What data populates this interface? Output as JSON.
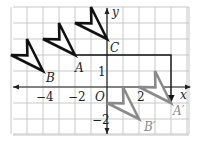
{
  "diagram": {
    "grid": {
      "x_min": -6,
      "x_max": 5,
      "y_min": -3,
      "y_max": 5,
      "origin_px": [
        107,
        87
      ],
      "unit_px": 16,
      "color": "#c8c8c8"
    },
    "axes": {
      "x_label": "x",
      "y_label": "y",
      "origin_label": "O",
      "x_tick_labels": [
        {
          "value": -4,
          "text": "−4"
        },
        {
          "value": -2,
          "text": "−2"
        },
        {
          "value": 2,
          "text": "2"
        }
      ],
      "y_tick_labels": [
        {
          "value": 1,
          "text": "1"
        },
        {
          "value": -2,
          "text": "−2"
        }
      ],
      "color": "#222222"
    },
    "figures": {
      "preimage_color": "#111111",
      "image_color": "#8a8a8a",
      "preimages": [
        {
          "name": "B",
          "label": "B",
          "tip": [
            -4,
            1
          ],
          "left_wing": [
            -6,
            2
          ],
          "top_wing": [
            -5,
            3
          ]
        },
        {
          "name": "A",
          "label": "A",
          "tip": [
            -2,
            2
          ],
          "left_wing": [
            -4,
            3
          ],
          "top_wing": [
            -3,
            4
          ]
        },
        {
          "name": "C",
          "label": "C",
          "tip": [
            0,
            3
          ],
          "left_wing": [
            -2,
            4
          ],
          "top_wing": [
            -1,
            5
          ]
        }
      ],
      "images": [
        {
          "name": "A'",
          "label": "A′",
          "tip": [
            4,
            -1
          ],
          "left_wing": [
            2,
            0
          ],
          "top_wing": [
            3,
            1
          ]
        },
        {
          "name": "B'",
          "label": "B′",
          "tip": [
            2,
            -2
          ],
          "left_wing": [
            0,
            -1
          ],
          "top_wing": [
            1,
            0
          ]
        }
      ]
    },
    "translation_path": {
      "from": [
        -2,
        2
      ],
      "corner": [
        4,
        2
      ],
      "to": [
        4,
        -1
      ],
      "description": "6 right, 3 down"
    }
  }
}
